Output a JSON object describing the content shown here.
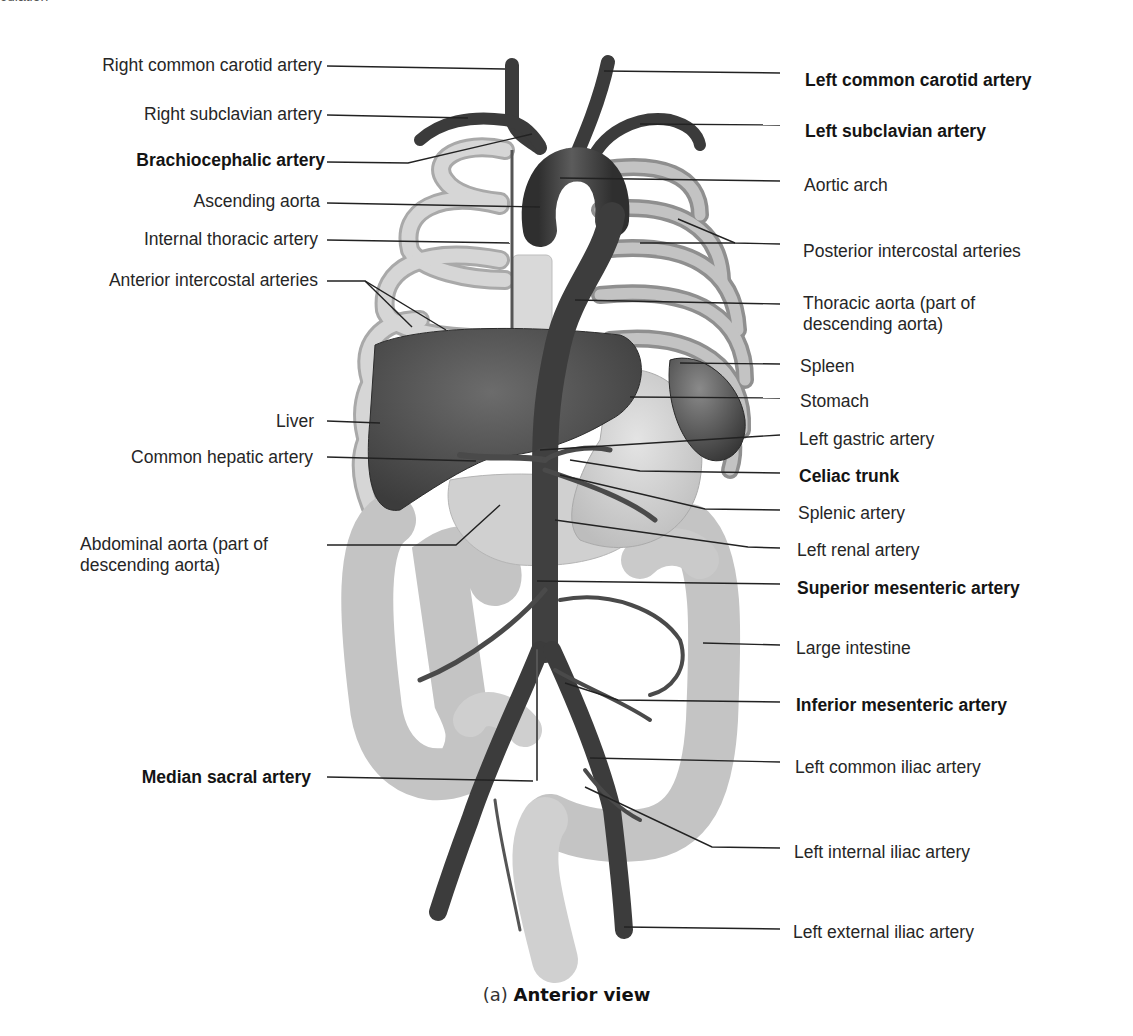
{
  "top_fragment": "culation",
  "caption": {
    "prefix": "(a)",
    "title": "Anterior view"
  },
  "colors": {
    "artery": "#3f3f3f",
    "artery_highlight": "#6a6a6a",
    "liver": "#4d4d4d",
    "spleen": "#5a5a5a",
    "rib": "#c9c9c9",
    "rib_shadow": "#a8a8a8",
    "organ_light": "#d3d3d3",
    "intestine": "#c6c6c6",
    "leader_line": "#222222"
  },
  "labels_left": [
    {
      "id": "right-common-carotid-artery",
      "text": "Right common carotid artery",
      "bold": false
    },
    {
      "id": "right-subclavian-artery",
      "text": "Right subclavian artery",
      "bold": false
    },
    {
      "id": "brachiocephalic-artery",
      "text": "Brachiocephalic artery",
      "bold": true
    },
    {
      "id": "ascending-aorta",
      "text": "Ascending aorta",
      "bold": false
    },
    {
      "id": "internal-thoracic-artery",
      "text": "Internal thoracic artery",
      "bold": false
    },
    {
      "id": "anterior-intercostal-arteries",
      "text": "Anterior intercostal arteries",
      "bold": false
    },
    {
      "id": "liver",
      "text": "Liver",
      "bold": false
    },
    {
      "id": "common-hepatic-artery",
      "text": "Common hepatic artery",
      "bold": false
    },
    {
      "id": "abdominal-aorta",
      "text": "Abdominal aorta (part of descending aorta)",
      "line1": "Abdominal aorta (part of",
      "line2": "descending aorta)",
      "bold": false
    },
    {
      "id": "median-sacral-artery",
      "text": "Median sacral artery",
      "bold": true
    }
  ],
  "labels_right": [
    {
      "id": "left-common-carotid-artery",
      "text": "Left common carotid artery",
      "bold": true
    },
    {
      "id": "left-subclavian-artery",
      "text": "Left subclavian artery",
      "bold": true
    },
    {
      "id": "aortic-arch",
      "text": "Aortic arch",
      "bold": false
    },
    {
      "id": "posterior-intercostal-arteries",
      "text": "Posterior intercostal arteries",
      "bold": false
    },
    {
      "id": "thoracic-aorta",
      "text": "Thoracic aorta (part of descending aorta)",
      "line1": "Thoracic aorta (part of",
      "line2": "descending aorta)",
      "bold": false
    },
    {
      "id": "spleen",
      "text": "Spleen",
      "bold": false
    },
    {
      "id": "stomach",
      "text": "Stomach",
      "bold": false
    },
    {
      "id": "left-gastric-artery",
      "text": "Left gastric artery",
      "bold": false
    },
    {
      "id": "celiac-trunk",
      "text": "Celiac trunk",
      "bold": true
    },
    {
      "id": "splenic-artery",
      "text": "Splenic artery",
      "bold": false
    },
    {
      "id": "left-renal-artery",
      "text": "Left renal artery",
      "bold": false
    },
    {
      "id": "superior-mesenteric-artery",
      "text": "Superior mesenteric artery",
      "bold": true
    },
    {
      "id": "large-intestine",
      "text": "Large intestine",
      "bold": false
    },
    {
      "id": "inferior-mesenteric-artery",
      "text": "Inferior mesenteric artery",
      "bold": true
    },
    {
      "id": "left-common-iliac-artery",
      "text": "Left common iliac artery",
      "bold": false
    },
    {
      "id": "left-internal-iliac-artery",
      "text": "Left internal iliac artery",
      "bold": false
    },
    {
      "id": "left-external-iliac-artery",
      "text": "Left external iliac artery",
      "bold": false
    }
  ]
}
